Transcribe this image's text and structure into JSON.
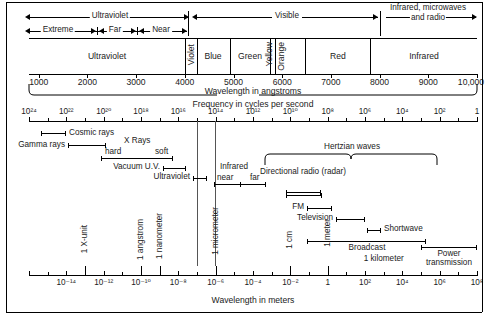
{
  "figure": {
    "axis_angstrom_label": "Wavelength in angstroms",
    "axis_frequency_label": "Frequency in cycles per second",
    "axis_meters_label": "Wavelength in meters"
  },
  "top_ranges": {
    "ultraviolet": "Ultraviolet",
    "visible": "Visible",
    "infrared_micro_radio_line1": "Infrared, microwaves",
    "infrared_micro_radio_line2": "and radio",
    "extreme": "Extreme",
    "far": "Far",
    "near": "Near"
  },
  "visible_bands": [
    {
      "name": "Ultraviolet",
      "orientation": "horizontal",
      "start_a": 800,
      "end_a": 4000
    },
    {
      "name": "Violet",
      "orientation": "vertical",
      "start_a": 4000,
      "end_a": 4240
    },
    {
      "name": "Blue",
      "orientation": "horizontal",
      "start_a": 4240,
      "end_a": 4920
    },
    {
      "name": "Green",
      "orientation": "horizontal",
      "start_a": 4920,
      "end_a": 5750
    },
    {
      "name": "Yellow",
      "orientation": "vertical",
      "start_a": 5750,
      "end_a": 5850
    },
    {
      "name": "Orange",
      "orientation": "vertical",
      "start_a": 5850,
      "end_a": 6470
    },
    {
      "name": "Red",
      "orientation": "horizontal",
      "start_a": 6470,
      "end_a": 7800
    },
    {
      "name": "Infrared",
      "orientation": "horizontal",
      "start_a": 7800,
      "end_a": 10000
    }
  ],
  "angstrom_axis": {
    "label": "Wavelength in angstroms",
    "ticks": [
      "1000",
      "2000",
      "3000",
      "4000",
      "5000",
      "6000",
      "7000",
      "8000",
      "9000",
      "10,000"
    ],
    "values": [
      1000,
      2000,
      3000,
      4000,
      5000,
      6000,
      7000,
      8000,
      9000,
      10000
    ],
    "min": 800,
    "max": 10000
  },
  "frequency_axis": {
    "label": "Frequency in cycles per second",
    "ticks": [
      "10²⁴",
      "10²²",
      "10²⁰",
      "10¹⁸",
      "10¹⁶",
      "10¹⁴",
      "10¹²",
      "10¹⁰",
      "10⁸",
      "10⁶",
      "10⁴",
      "10²",
      "1"
    ],
    "exponents": [
      24,
      22,
      20,
      18,
      16,
      14,
      12,
      10,
      8,
      6,
      4,
      2,
      0
    ]
  },
  "meters_axis": {
    "label": "Wavelength in meters",
    "ticks": [
      "10⁻¹⁶",
      "10⁻¹⁴",
      "10⁻¹²",
      "10⁻¹⁰",
      "10⁻⁸",
      "10⁻⁶",
      "10⁻⁴",
      "10⁻²",
      "1",
      "10²",
      "10⁴",
      "10⁶",
      "10⁸"
    ],
    "exponents": [
      -16,
      -14,
      -12,
      -10,
      -8,
      -6,
      -4,
      -2,
      0,
      2,
      4,
      6,
      8
    ]
  },
  "spectrum_bands": [
    {
      "label": "Gamma rays",
      "side": "right",
      "from_exp": -14.6,
      "to_exp": -11.6
    },
    {
      "label": "Cosmic rays",
      "side": "right",
      "from_exp": -16.0,
      "to_exp": -14.4
    },
    {
      "label": "X Rays",
      "side": "center",
      "from_exp": -12.1,
      "to_exp": -8.0
    },
    {
      "label": "hard",
      "side": "none",
      "from_exp": -12.1,
      "to_exp": -10.4
    },
    {
      "label": "soft",
      "side": "none",
      "from_exp": -10.4,
      "to_exp": -8.0
    },
    {
      "label": "Vacuum U.V.",
      "side": "right",
      "from_exp": -8.0,
      "to_exp": -7.1
    },
    {
      "label": "Ultraviolet",
      "side": "right",
      "from_exp": -7.1,
      "to_exp": -6.6
    },
    {
      "label": "Infrared",
      "side": "center",
      "from_exp": -6.3,
      "to_exp": -3.9
    },
    {
      "label": "near",
      "side": "none",
      "from_exp": -6.3,
      "to_exp": -5.2
    },
    {
      "label": "far",
      "side": "none",
      "from_exp": -5.2,
      "to_exp": -3.9
    },
    {
      "label": "Hertzian waves",
      "side": "center",
      "from_exp": -3.6,
      "to_exp": 5.2
    },
    {
      "label": "Directional radio (radar)",
      "side": "center",
      "from_exp": -2.0,
      "to_exp": -0.3
    },
    {
      "label": "FM",
      "side": "right",
      "from_exp": 0.3,
      "to_exp": 1.2
    },
    {
      "label": "Television",
      "side": "right",
      "from_exp": 0.9,
      "to_exp": 2.3
    },
    {
      "label": "Shortwave",
      "side": "left",
      "from_exp": 1.9,
      "to_exp": 2.5
    },
    {
      "label": "Broadcast",
      "side": "center",
      "from_exp": 0.0,
      "to_exp": 5.3
    },
    {
      "label": "Power transmission",
      "side": "center",
      "from_exp": 5.2,
      "to_exp": 8.0
    }
  ],
  "markers": [
    {
      "label": "1 X-unit",
      "exp": -13.0
    },
    {
      "label": "1 angstrom",
      "exp": -10.0
    },
    {
      "label": "1 nanometer",
      "exp": -9.0
    },
    {
      "label": "1 micrometer",
      "exp": -6.0
    },
    {
      "label": "1 cm",
      "exp": -2.0
    },
    {
      "label": "1 meter",
      "exp": 0.0
    },
    {
      "label": "1 kilometer",
      "exp": 3.0
    }
  ],
  "chart_data": {
    "type": "diagram",
    "xlabel": "Wavelength in meters",
    "secondary_xlabels": [
      "Wavelength in angstroms",
      "Frequency in cycles per second"
    ],
    "note": "Log-scale spectrum chart; top inset expands the 800-10,000 angstrom visible region."
  },
  "colors": {
    "ink": "#1a1a1a",
    "line": "#000000",
    "background": "#ffffff"
  }
}
